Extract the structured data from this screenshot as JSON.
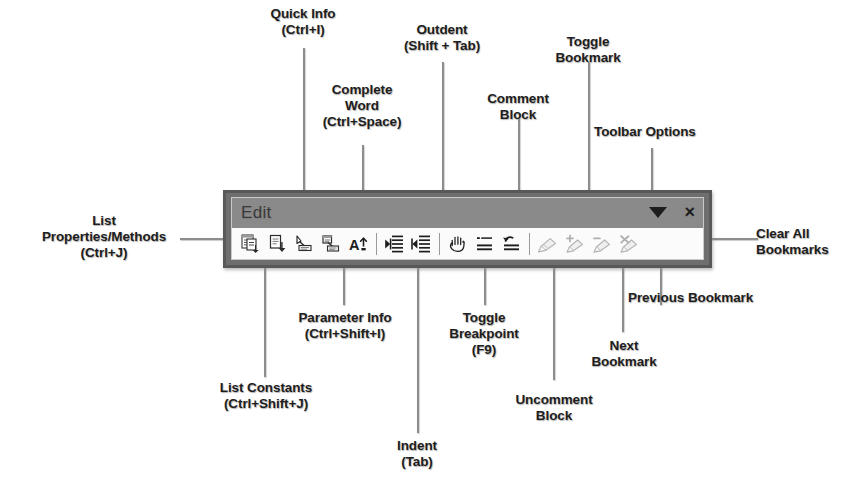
{
  "toolbar": {
    "title": "Edit",
    "options_icon": "triangle-down-icon",
    "close_label": "×",
    "buttons": [
      {
        "id": "list-properties-methods",
        "icon": "list-properties-methods-icon",
        "tooltip": "List Properties/Methods"
      },
      {
        "id": "list-constants",
        "icon": "list-constants-icon",
        "tooltip": "List Constants"
      },
      {
        "id": "quick-info",
        "icon": "quick-info-icon",
        "tooltip": "Quick Info"
      },
      {
        "id": "parameter-info",
        "icon": "parameter-info-icon",
        "tooltip": "Parameter Info"
      },
      {
        "id": "complete-word",
        "icon": "complete-word-icon",
        "tooltip": "Complete Word"
      },
      {
        "id": "indent",
        "icon": "indent-icon",
        "tooltip": "Indent"
      },
      {
        "id": "outdent",
        "icon": "outdent-icon",
        "tooltip": "Outdent"
      },
      {
        "id": "toggle-breakpoint",
        "icon": "hand-breakpoint-icon",
        "tooltip": "Toggle Breakpoint"
      },
      {
        "id": "comment-block",
        "icon": "comment-block-icon",
        "tooltip": "Comment Block"
      },
      {
        "id": "uncomment-block",
        "icon": "uncomment-block-icon",
        "tooltip": "Uncomment Block"
      },
      {
        "id": "toggle-bookmark",
        "icon": "bookmark-icon",
        "tooltip": "Toggle Bookmark"
      },
      {
        "id": "next-bookmark",
        "icon": "next-bookmark-icon",
        "tooltip": "Next Bookmark"
      },
      {
        "id": "previous-bookmark",
        "icon": "previous-bookmark-icon",
        "tooltip": "Previous Bookmark"
      },
      {
        "id": "clear-all-bookmarks",
        "icon": "clear-all-bookmarks-icon",
        "tooltip": "Clear All Bookmarks"
      }
    ]
  },
  "annotations": {
    "quick_info": "Quick Info\n(Ctrl+I)",
    "complete_word": "Complete\nWord\n(Ctrl+Space)",
    "outdent": "Outdent\n(Shift + Tab)",
    "comment_block": "Comment\nBlock",
    "toggle_bookmark": "Toggle\nBookmark",
    "toolbar_options": "Toolbar Options",
    "list_properties_methods": "List\nProperties/Methods\n(Ctrl+J)",
    "clear_all_bookmarks": "Clear All\nBookmarks",
    "parameter_info": "Parameter Info\n(Ctrl+Shift+I)",
    "toggle_breakpoint": "Toggle\nBreakpoint\n(F9)",
    "next_bookmark": "Next\nBookmark",
    "previous_bookmark": "Previous Bookmark",
    "list_constants": "List Constants\n(Ctrl+Shift+J)",
    "indent": "Indent\n(Tab)",
    "uncomment_block": "Uncomment\nBlock"
  },
  "colors": {
    "toolbar_border": "#585858",
    "toolbar_face": "#8a8a8a",
    "icon_strip": "#fbfbfb",
    "leader_line": "#8d8d8d",
    "text": "#1e1e1e"
  }
}
